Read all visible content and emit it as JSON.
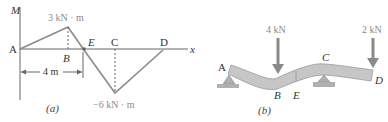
{
  "figure_a": {
    "caption": "(a)",
    "axis_y_label": "M",
    "axis_x_label": "x",
    "points": {
      "A": "A",
      "B": "B",
      "E": "E",
      "C": "C",
      "D": "D"
    },
    "max_moment_label": "3 kN · m",
    "min_moment_label": "−6 kN · m",
    "dimension_label": "4 m"
  },
  "figure_b": {
    "caption": "(b)",
    "load_B": "4 kN",
    "load_D": "2 kN",
    "points": {
      "A": "A",
      "B": "B",
      "E": "E",
      "C": "C",
      "D": "D"
    }
  },
  "colors": {
    "moment_line": "#8a8a8a",
    "axis": "#666666",
    "beam_fill": "#c8c8c8",
    "arrow": "#8a8a8a",
    "support": "#a0a0a0"
  }
}
